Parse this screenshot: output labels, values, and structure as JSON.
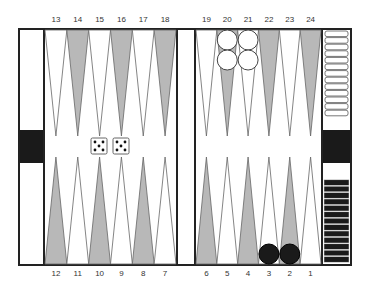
{
  "game": "backgammon",
  "top_labels": [
    "13",
    "14",
    "15",
    "16",
    "17",
    "18",
    "19",
    "20",
    "21",
    "22",
    "23",
    "24"
  ],
  "bottom_labels": [
    "12",
    "11",
    "10",
    "9",
    "8",
    "7",
    "6",
    "5",
    "4",
    "3",
    "2",
    "1"
  ],
  "dice": [
    5,
    5
  ],
  "checkers": {
    "white": [
      {
        "point": 20,
        "count": 2
      },
      {
        "point": 21,
        "count": 2
      }
    ],
    "black": [
      {
        "point": 3,
        "count": 1
      },
      {
        "point": 2,
        "count": 1
      }
    ]
  },
  "borne_off": {
    "white": 13,
    "black": 13
  },
  "colors": {
    "dark_point": "#b8b8b8",
    "light_point": "#ffffff",
    "frame": "#222222",
    "black_checker": "#1a1a1a",
    "white_checker": "#ffffff"
  }
}
